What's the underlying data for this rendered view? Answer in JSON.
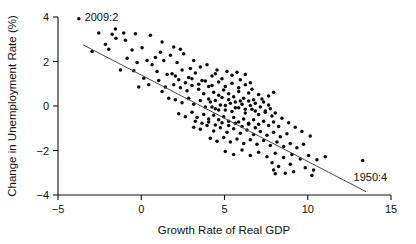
{
  "chart_data": {
    "type": "scatter",
    "title": "",
    "xlabel": "Growth Rate of  Real GDP",
    "ylabel": "Change in Unemployment Rate (%)",
    "xlim": [
      -5,
      15
    ],
    "ylim": [
      -4,
      4
    ],
    "xticks": [
      -5,
      0,
      5,
      10,
      15
    ],
    "xtick_labels": [
      "−5",
      "0",
      "5",
      "10",
      "15"
    ],
    "yticks": [
      4,
      2,
      0,
      -2,
      -4
    ],
    "ytick_labels": [
      "4",
      "2",
      "0",
      "−2",
      "−4"
    ],
    "grid": false,
    "legend": "none",
    "marker_color": "#060606",
    "line_color": "#4a4a4a",
    "axis_color": "#111111",
    "fit_line": {
      "name": "Okun's Law regression",
      "x_start": -3.5,
      "y_start": 2.75,
      "x_end": 13.5,
      "y_end": -3.85,
      "slope": -0.388,
      "intercept": 1.392
    },
    "annotations": [
      {
        "label": "2009:2",
        "x": -3.75,
        "y": 3.92,
        "text_dx": 0.35,
        "text_dy": 0.08
      },
      {
        "label": "1950:4",
        "x": 13.3,
        "y": -2.45,
        "text_dx": -0.55,
        "text_dy": -0.72
      }
    ],
    "points": [
      [
        -3.75,
        3.92
      ],
      [
        -2.55,
        3.28
      ],
      [
        -1.75,
        3.22
      ],
      [
        -1.55,
        3.46
      ],
      [
        -1.52,
        3.05
      ],
      [
        -1.05,
        3.28
      ],
      [
        -0.95,
        2.95
      ],
      [
        -0.35,
        3.25
      ],
      [
        0.55,
        3.18
      ],
      [
        1.15,
        2.42
      ],
      [
        -2.15,
        2.78
      ],
      [
        -1.95,
        2.55
      ],
      [
        -0.55,
        2.52
      ],
      [
        0.05,
        2.62
      ],
      [
        0.85,
        2.18
      ],
      [
        1.35,
        2.05
      ],
      [
        1.75,
        2.28
      ],
      [
        2.15,
        1.95
      ],
      [
        2.55,
        2.35
      ],
      [
        2.95,
        1.68
      ],
      [
        -1.25,
        1.62
      ],
      [
        -0.45,
        1.58
      ],
      [
        0.35,
        2.05
      ],
      [
        0.95,
        1.55
      ],
      [
        1.55,
        1.42
      ],
      [
        2.05,
        1.35
      ],
      [
        2.45,
        1.62
      ],
      [
        2.85,
        1.28
      ],
      [
        3.25,
        1.48
      ],
      [
        3.65,
        1.15
      ],
      [
        3.95,
        1.85
      ],
      [
        4.25,
        1.35
      ],
      [
        4.55,
        1.62
      ],
      [
        4.85,
        1.22
      ],
      [
        5.15,
        1.55
      ],
      [
        5.45,
        1.38
      ],
      [
        5.75,
        1.52
      ],
      [
        5.95,
        1.18
      ],
      [
        6.25,
        1.42
      ],
      [
        6.55,
        1.05
      ],
      [
        1.95,
        0.95
      ],
      [
        2.35,
        0.82
      ],
      [
        2.75,
        0.68
      ],
      [
        3.05,
        0.92
      ],
      [
        3.45,
        0.75
      ],
      [
        3.75,
        0.55
      ],
      [
        4.05,
        0.88
      ],
      [
        4.35,
        0.62
      ],
      [
        4.65,
        0.48
      ],
      [
        4.95,
        0.72
      ],
      [
        5.25,
        0.55
      ],
      [
        5.55,
        0.42
      ],
      [
        5.85,
        0.65
      ],
      [
        6.15,
        0.35
      ],
      [
        6.45,
        0.58
      ],
      [
        6.75,
        0.28
      ],
      [
        7.05,
        0.52
      ],
      [
        7.35,
        0.18
      ],
      [
        7.65,
        0.45
      ],
      [
        7.95,
        0.62
      ],
      [
        2.05,
        0.28
      ],
      [
        2.45,
        0.15
      ],
      [
        2.85,
        0.35
      ],
      [
        3.15,
        0.08
      ],
      [
        3.55,
        0.25
      ],
      [
        3.85,
        -0.05
      ],
      [
        4.15,
        0.18
      ],
      [
        4.45,
        -0.12
      ],
      [
        4.75,
        0.05
      ],
      [
        5.05,
        -0.18
      ],
      [
        5.35,
        0.12
      ],
      [
        5.65,
        -0.08
      ],
      [
        5.95,
        0.22
      ],
      [
        6.25,
        -0.15
      ],
      [
        6.55,
        0.02
      ],
      [
        6.85,
        -0.22
      ],
      [
        7.15,
        -0.05
      ],
      [
        7.45,
        -0.28
      ],
      [
        7.75,
        -0.12
      ],
      [
        8.05,
        -0.32
      ],
      [
        2.25,
        -0.35
      ],
      [
        2.65,
        -0.48
      ],
      [
        3.05,
        -0.28
      ],
      [
        3.35,
        -0.52
      ],
      [
        3.75,
        -0.38
      ],
      [
        4.05,
        -0.58
      ],
      [
        4.35,
        -0.42
      ],
      [
        4.65,
        -0.62
      ],
      [
        4.95,
        -0.48
      ],
      [
        5.25,
        -0.68
      ],
      [
        5.55,
        -0.52
      ],
      [
        5.85,
        -0.72
      ],
      [
        6.15,
        -0.58
      ],
      [
        6.45,
        -0.78
      ],
      [
        6.75,
        -0.62
      ],
      [
        7.05,
        -0.82
      ],
      [
        7.35,
        -0.68
      ],
      [
        7.65,
        -0.88
      ],
      [
        7.95,
        -0.72
      ],
      [
        8.25,
        -0.92
      ],
      [
        3.15,
        -0.95
      ],
      [
        3.55,
        -1.05
      ],
      [
        3.95,
        -0.88
      ],
      [
        4.35,
        -1.12
      ],
      [
        4.75,
        -0.98
      ],
      [
        5.15,
        -1.18
      ],
      [
        5.55,
        -1.02
      ],
      [
        5.95,
        -1.22
      ],
      [
        6.35,
        -1.08
      ],
      [
        6.75,
        -1.28
      ],
      [
        7.15,
        -1.15
      ],
      [
        7.55,
        -1.32
      ],
      [
        7.95,
        -1.18
      ],
      [
        8.35,
        -1.38
      ],
      [
        8.75,
        -1.25
      ],
      [
        4.15,
        -1.45
      ],
      [
        4.55,
        -1.58
      ],
      [
        4.95,
        -1.42
      ],
      [
        5.35,
        -1.62
      ],
      [
        5.75,
        -1.48
      ],
      [
        6.15,
        -1.68
      ],
      [
        6.55,
        -1.52
      ],
      [
        6.95,
        -1.72
      ],
      [
        7.35,
        -1.55
      ],
      [
        7.75,
        -1.78
      ],
      [
        8.15,
        -1.62
      ],
      [
        8.55,
        -1.82
      ],
      [
        8.95,
        -1.68
      ],
      [
        9.35,
        -1.88
      ],
      [
        9.75,
        -1.72
      ],
      [
        5.05,
        -2.05
      ],
      [
        5.55,
        -2.18
      ],
      [
        6.05,
        -1.98
      ],
      [
        6.55,
        -2.22
      ],
      [
        7.05,
        -2.08
      ],
      [
        7.55,
        -2.28
      ],
      [
        8.05,
        -2.12
      ],
      [
        8.55,
        -2.32
      ],
      [
        9.05,
        -2.18
      ],
      [
        9.55,
        -2.38
      ],
      [
        10.05,
        -2.22
      ],
      [
        10.55,
        -2.42
      ],
      [
        11.05,
        -2.28
      ],
      [
        13.3,
        -2.45
      ],
      [
        0.45,
        0.95
      ],
      [
        1.25,
        0.65
      ],
      [
        1.65,
        0.35
      ],
      [
        0.15,
        1.25
      ],
      [
        -0.15,
        0.85
      ],
      [
        1.05,
        1.15
      ],
      [
        1.45,
        0.85
      ],
      [
        1.85,
        1.45
      ],
      [
        2.25,
        1.18
      ],
      [
        2.65,
        1.05
      ],
      [
        3.05,
        1.22
      ],
      [
        3.45,
        0.98
      ],
      [
        3.85,
        1.12
      ],
      [
        4.25,
        0.92
      ],
      [
        4.65,
        1.08
      ],
      [
        5.05,
        0.88
      ],
      [
        5.45,
        1.02
      ],
      [
        5.85,
        0.82
      ],
      [
        6.25,
        0.95
      ],
      [
        6.65,
        0.75
      ],
      [
        4.05,
        0.32
      ],
      [
        4.45,
        0.25
      ],
      [
        4.85,
        0.38
      ],
      [
        5.25,
        0.28
      ],
      [
        5.65,
        0.18
      ],
      [
        6.05,
        0.08
      ],
      [
        6.45,
        0.22
      ],
      [
        6.85,
        0.12
      ],
      [
        7.25,
        0.32
      ],
      [
        7.65,
        0.05
      ],
      [
        4.25,
        -0.05
      ],
      [
        4.65,
        -0.18
      ],
      [
        5.05,
        0.02
      ],
      [
        5.45,
        -0.25
      ],
      [
        5.85,
        -0.08
      ],
      [
        6.25,
        -0.32
      ],
      [
        6.65,
        -0.15
      ],
      [
        7.05,
        -0.38
      ],
      [
        7.45,
        -0.22
      ],
      [
        7.85,
        -0.45
      ],
      [
        3.25,
        -0.68
      ],
      [
        3.65,
        -0.78
      ],
      [
        4.05,
        -0.72
      ],
      [
        4.45,
        -0.85
      ],
      [
        4.85,
        -0.75
      ],
      [
        5.25,
        -0.88
      ],
      [
        5.65,
        -0.78
      ],
      [
        6.05,
        -0.92
      ],
      [
        6.45,
        -0.82
      ],
      [
        6.85,
        -0.98
      ],
      [
        8.45,
        -0.55
      ],
      [
        8.85,
        -0.75
      ],
      [
        9.25,
        -0.95
      ],
      [
        9.65,
        -1.15
      ],
      [
        10.15,
        -1.35
      ],
      [
        7.85,
        -2.55
      ],
      [
        8.25,
        -2.72
      ],
      [
        8.95,
        -2.62
      ],
      [
        9.85,
        -2.78
      ],
      [
        10.35,
        -2.88
      ],
      [
        8.05,
        -3.05
      ],
      [
        9.15,
        -2.95
      ],
      [
        10.25,
        -3.12
      ],
      [
        7.95,
        -2.88
      ],
      [
        8.65,
        -3.02
      ],
      [
        1.95,
        2.65
      ],
      [
        0.65,
        1.85
      ],
      [
        -0.85,
        2.15
      ],
      [
        2.35,
        2.55
      ],
      [
        3.15,
        2.05
      ],
      [
        -2.95,
        2.45
      ],
      [
        -0.25,
        1.95
      ],
      [
        1.25,
        2.88
      ],
      [
        3.55,
        1.75
      ],
      [
        4.45,
        1.45
      ]
    ]
  }
}
